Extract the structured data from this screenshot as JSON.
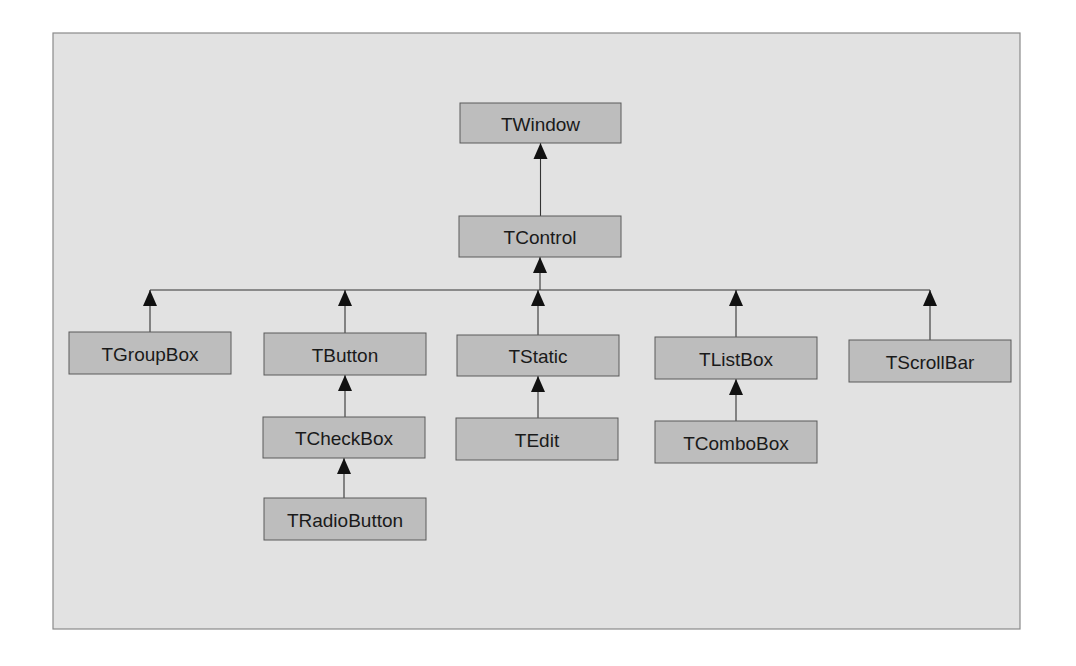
{
  "diagram": {
    "title": "",
    "type": "class-hierarchy",
    "colors": {
      "frame_fill": "#e2e2e2",
      "box_fill": "#bdbdbd",
      "box_stroke": "#5a5a5a",
      "edge": "#333333",
      "text": "#1a1a1a"
    },
    "nodes": [
      {
        "id": "TWindow",
        "label": "TWindow"
      },
      {
        "id": "TControl",
        "label": "TControl"
      },
      {
        "id": "TGroupBox",
        "label": "TGroupBox"
      },
      {
        "id": "TButton",
        "label": "TButton"
      },
      {
        "id": "TStatic",
        "label": "TStatic"
      },
      {
        "id": "TListBox",
        "label": "TListBox"
      },
      {
        "id": "TScrollBar",
        "label": "TScrollBar"
      },
      {
        "id": "TCheckBox",
        "label": "TCheckBox"
      },
      {
        "id": "TEdit",
        "label": "TEdit"
      },
      {
        "id": "TComboBox",
        "label": "TComboBox"
      },
      {
        "id": "TRadioButton",
        "label": "TRadioButton"
      }
    ],
    "edges": [
      {
        "from": "TControl",
        "to": "TWindow",
        "relation": "inherits"
      },
      {
        "from": "TGroupBox",
        "to": "TControl",
        "relation": "inherits"
      },
      {
        "from": "TButton",
        "to": "TControl",
        "relation": "inherits"
      },
      {
        "from": "TStatic",
        "to": "TControl",
        "relation": "inherits"
      },
      {
        "from": "TListBox",
        "to": "TControl",
        "relation": "inherits"
      },
      {
        "from": "TScrollBar",
        "to": "TControl",
        "relation": "inherits"
      },
      {
        "from": "TCheckBox",
        "to": "TButton",
        "relation": "inherits"
      },
      {
        "from": "TRadioButton",
        "to": "TCheckBox",
        "relation": "inherits"
      },
      {
        "from": "TEdit",
        "to": "TStatic",
        "relation": "inherits"
      },
      {
        "from": "TComboBox",
        "to": "TListBox",
        "relation": "inherits"
      }
    ]
  }
}
